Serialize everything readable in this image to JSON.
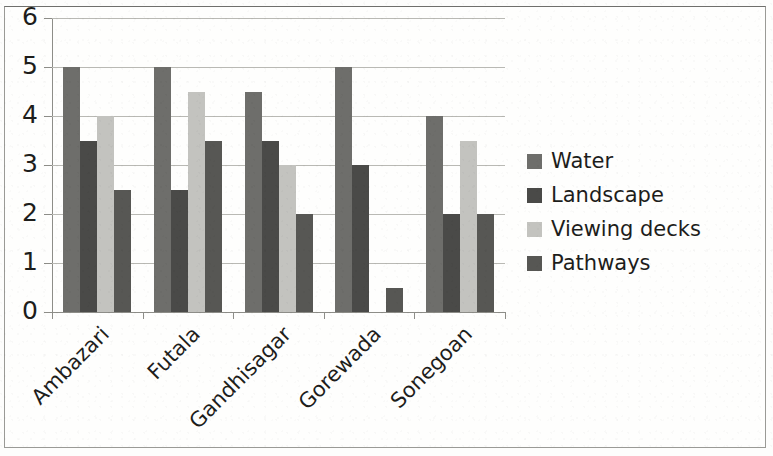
{
  "chart_data": {
    "type": "bar",
    "title": "",
    "xlabel": "",
    "ylabel": "",
    "ylim": [
      0,
      6
    ],
    "yticks": [
      "0",
      "1",
      "2",
      "3",
      "4",
      "5",
      "6"
    ],
    "grid": true,
    "legend_position": "right",
    "categories": [
      "Ambazari",
      "Futala",
      "Gandhisagar",
      "Gorewada",
      "Sonegoan"
    ],
    "series": [
      {
        "name": "Water",
        "color": "#6e6e6b",
        "values": [
          5,
          5,
          4.5,
          5,
          4
        ]
      },
      {
        "name": "Landscape",
        "color": "#4a4a48",
        "values": [
          3.5,
          2.5,
          3.5,
          3,
          2
        ]
      },
      {
        "name": "Viewing decks",
        "color": "#c3c3bf",
        "values": [
          4,
          4.5,
          3,
          0,
          3.5
        ]
      },
      {
        "name": "Pathways",
        "color": "#575754",
        "values": [
          2.5,
          3.5,
          2,
          0.5,
          2
        ]
      }
    ]
  }
}
